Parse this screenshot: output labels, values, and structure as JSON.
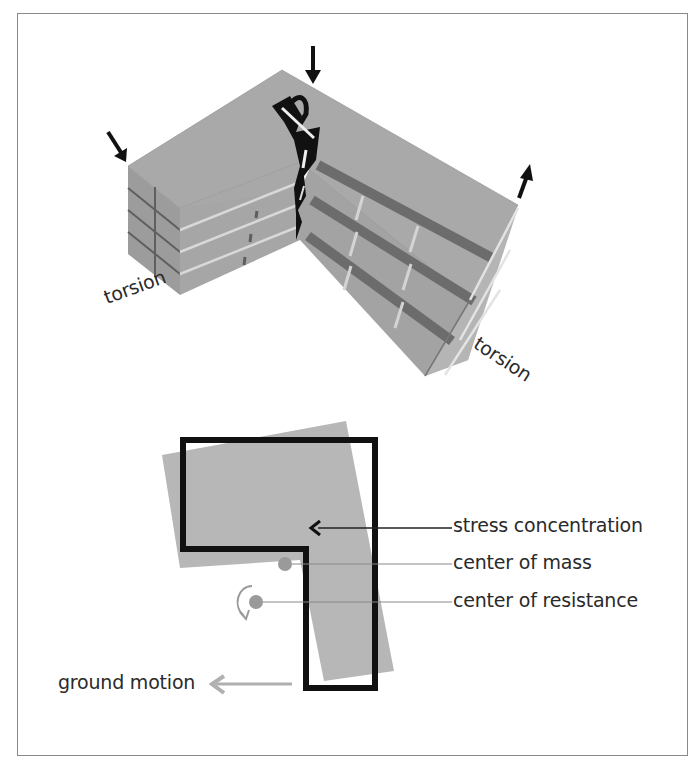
{
  "figure": {
    "type": "building torsion diagram",
    "top_view": {
      "description": "3D L-shaped building under torsion",
      "labels": {
        "torsion_left": "torsion",
        "torsion_right": "torsion"
      },
      "force_arrows": [
        {
          "position": "left corner",
          "direction": "down"
        },
        {
          "position": "re-entrant corner",
          "direction": "down"
        },
        {
          "position": "right end",
          "direction": "up"
        }
      ]
    },
    "plan_view": {
      "description": "L-shaped plan outline with rotated displaced footprint",
      "labels": {
        "stress_concentration": "stress concentration",
        "center_of_mass": "center of mass",
        "center_of_resistance": "center of resistance",
        "ground_motion": "ground motion"
      }
    },
    "colors": {
      "building_fill": "#a9a9a9",
      "building_dark": "#6e6e6e",
      "outline": "#111111",
      "shadow_fill": "#b8b8b8",
      "marker": "#9a9a9a",
      "text": "#2a2a2a",
      "frame": "#8a8a8a"
    }
  }
}
